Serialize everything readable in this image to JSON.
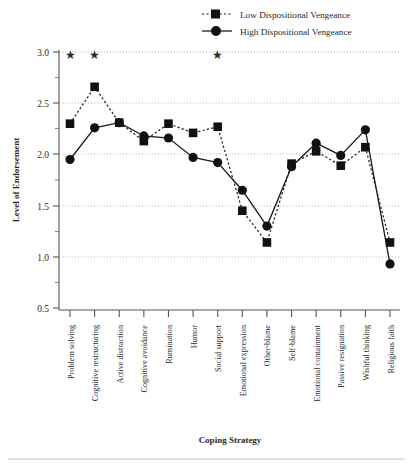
{
  "chart_data": {
    "type": "line",
    "title": "",
    "xlabel": "Coping Strategy",
    "ylabel": "Level of Endorsement",
    "ylim": [
      0.5,
      3.0
    ],
    "yticks": [
      "0.5",
      "1.0",
      "1.5",
      "2.0",
      "2.5",
      "3.0"
    ],
    "ytick_values": [
      0.5,
      1.0,
      1.5,
      2.0,
      2.5,
      3.0
    ],
    "minor_tick_step": 0.25,
    "grid": "horizontal dotted gridlines at major y ticks",
    "legend_position": "top-right",
    "categories": [
      "Problem solving",
      "Cognitive restructuring",
      "Active distraction",
      "Cognitive avoidance",
      "Rumination",
      "Humor",
      "Social support",
      "Emotional expression",
      "Other-blame",
      "Self-blame",
      "Emotional containment",
      "Passive resignation",
      "Wishful thinking",
      "Religious faith"
    ],
    "series": [
      {
        "name": "Low Dispositional Vengeance",
        "marker": "square",
        "linestyle": "dotted",
        "color": "#111111",
        "values": [
          2.3,
          2.66,
          2.31,
          2.13,
          2.3,
          2.21,
          2.27,
          1.45,
          1.14,
          1.91,
          2.03,
          1.89,
          2.07,
          1.14
        ]
      },
      {
        "name": "High Dispositional Vengeance",
        "marker": "circle",
        "linestyle": "solid",
        "color": "#111111",
        "values": [
          1.95,
          2.26,
          2.31,
          2.18,
          2.16,
          1.97,
          1.92,
          1.65,
          1.3,
          1.88,
          2.11,
          1.99,
          2.24,
          0.93
        ]
      }
    ],
    "annotations": [
      {
        "symbol": "★",
        "category": "Problem solving",
        "y": 2.93,
        "meaning": "significant-difference-marker"
      },
      {
        "symbol": "★",
        "category": "Cognitive restructuring",
        "y": 2.93,
        "meaning": "significant-difference-marker"
      },
      {
        "symbol": "★",
        "category": "Social support",
        "y": 2.93,
        "meaning": "significant-difference-marker"
      }
    ]
  },
  "legend": {
    "items": [
      {
        "label": "Low Dispositional Vengeance"
      },
      {
        "label": "High Dispositional Vengeance"
      }
    ]
  },
  "axes": {
    "y_title": "Level of Endorsement",
    "x_title": "Coping Strategy"
  }
}
